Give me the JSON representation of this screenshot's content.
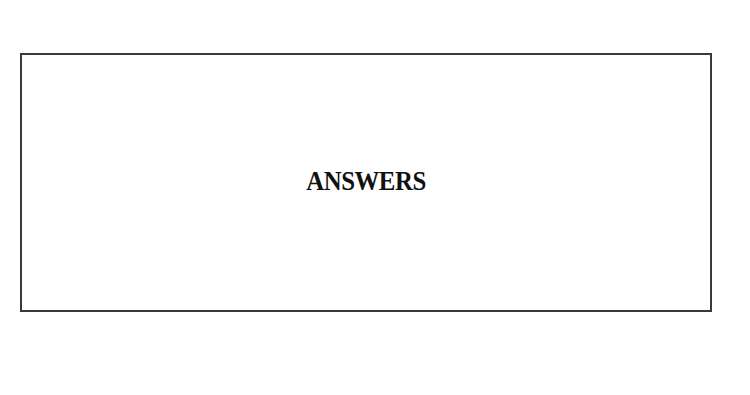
{
  "page": {
    "background": "#ffffff"
  },
  "answer_box": {
    "heading": "ANSWERS",
    "border_color": "#3a3a3a"
  }
}
